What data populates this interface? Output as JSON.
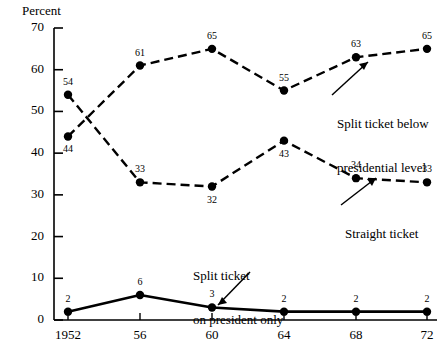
{
  "chart_data": {
    "type": "line",
    "title": "",
    "xlabel": "",
    "ylabel": "Percent",
    "ylim": [
      0,
      70
    ],
    "yticks": [
      0,
      10,
      20,
      30,
      40,
      50,
      60,
      70
    ],
    "grid": false,
    "legend_position": "inline-annotations",
    "categories": [
      "1952",
      "56",
      "60",
      "64",
      "68",
      "72"
    ],
    "x": [
      1952,
      1956,
      1960,
      1964,
      1968,
      1972
    ],
    "series": [
      {
        "name": "Split ticket below presidential level",
        "style": "dashed",
        "marker": "filled-circle",
        "values": [
          44,
          61,
          65,
          55,
          63,
          65
        ]
      },
      {
        "name": "Straight ticket",
        "style": "dashed",
        "marker": "filled-circle",
        "values": [
          54,
          33,
          32,
          43,
          34,
          33
        ]
      },
      {
        "name": "Split ticket on president only",
        "style": "solid",
        "marker": "filled-circle",
        "values": [
          2,
          6,
          3,
          2,
          2,
          2
        ]
      }
    ]
  },
  "axis": {
    "y_title": "Percent",
    "y_labels": [
      "70",
      "60",
      "50",
      "40",
      "30",
      "20",
      "10",
      "0"
    ],
    "x_labels": [
      "1952",
      "56",
      "60",
      "64",
      "68",
      "72"
    ]
  },
  "point_labels": {
    "split_below": [
      "44",
      "61",
      "65",
      "55",
      "63",
      "65"
    ],
    "straight": [
      "54",
      "33",
      "32",
      "43",
      "34",
      "33"
    ],
    "president_only": [
      "2",
      "6",
      "3",
      "2",
      "2",
      "2"
    ]
  },
  "annotations": {
    "split_below_line1": "Split ticket below",
    "split_below_line2": "presidential level",
    "straight": "Straight ticket",
    "president_only_line1": "Split ticket",
    "president_only_line2": "on president only"
  },
  "colors": {
    "ink": "#000000",
    "background": "#ffffff"
  }
}
